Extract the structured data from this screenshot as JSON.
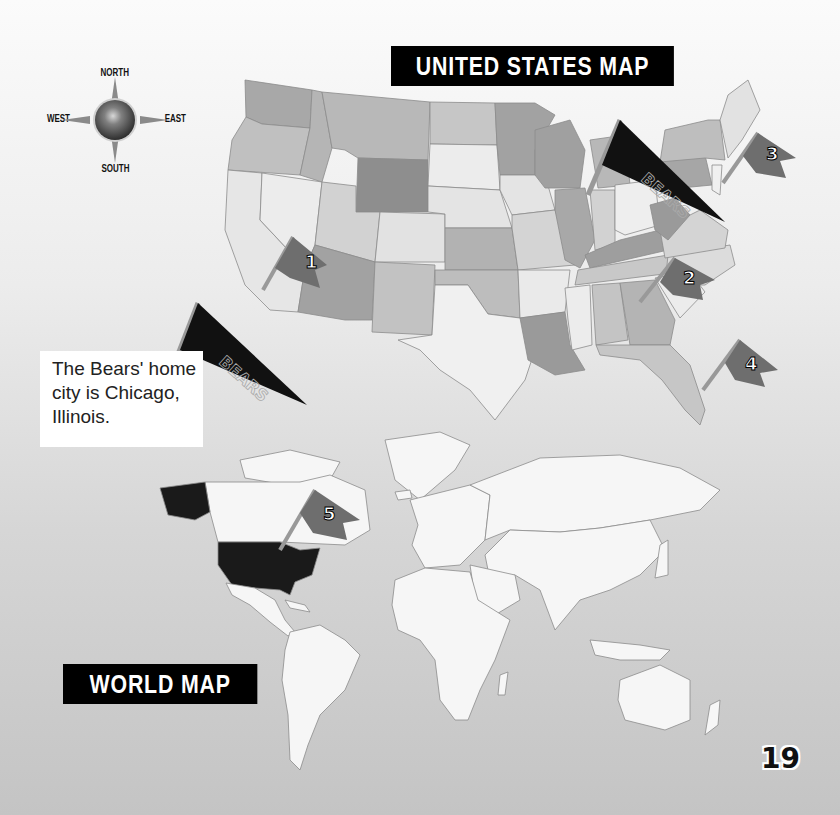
{
  "compass": {
    "north": "NORTH",
    "south": "SOUTH",
    "east": "EAST",
    "west": "WEST"
  },
  "us_map": {
    "title": "United States Map",
    "flags": [
      {
        "number": "1",
        "location": "southwest"
      },
      {
        "number": "2",
        "location": "southeast"
      },
      {
        "number": "3",
        "location": "northeast"
      },
      {
        "number": "4",
        "location": "florida"
      }
    ],
    "pennant_text": "BEARS"
  },
  "info_box": {
    "text": "The Bears' home city is Chicago, Illinois."
  },
  "world_map": {
    "title": "World Map",
    "flags": [
      {
        "number": "5",
        "location": "eastern canada"
      }
    ],
    "highlighted_country": "United States"
  },
  "page_number": "19",
  "colors": {
    "background_top": "#fbfbfb",
    "background_bottom": "#c4c4c4",
    "banner": "#000000",
    "flag": "#6e6e6e",
    "pennant": "#111111",
    "usa_highlight": "#1a1a1a",
    "land": "#f6f6f6"
  }
}
